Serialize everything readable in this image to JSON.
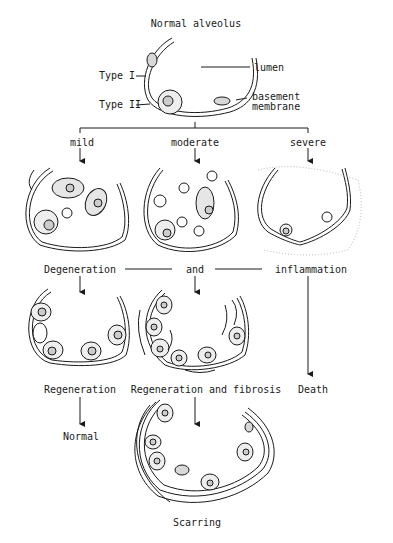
{
  "diagram": {
    "title": "Normal alveolus",
    "normal_alveolus": {
      "labels": {
        "type1": "Type I",
        "type2": "Type II",
        "lumen": "lumen",
        "basement1": "basement",
        "basement2": "membrane"
      }
    },
    "severity_branches": [
      {
        "label": "mild"
      },
      {
        "label": "moderate"
      },
      {
        "label": "severe"
      }
    ],
    "processes": {
      "degeneration": "Degeneration",
      "and": "and",
      "inflammation": "inflammation"
    },
    "outcomes": {
      "regeneration": "Regeneration",
      "regeneration_fibrosis": "Regeneration and fibrosis",
      "death": "Death",
      "normal": "Normal",
      "scarring": "Scarring"
    },
    "colors": {
      "ink": "#1a1a1a",
      "stipple": "#9a9a9a",
      "background": "#ffffff"
    }
  }
}
